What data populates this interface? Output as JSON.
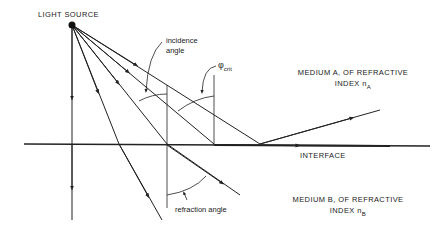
{
  "diagram": {
    "type": "refraction / total internal reflection ray diagram",
    "labels": {
      "light_source": "LIGHT SOURCE",
      "incidence_angle_line1": "incidence",
      "incidence_angle_line2": "angle",
      "critical_angle_symbol": "φ",
      "critical_angle_sub": "crit",
      "medium_a_line1": "MEDIUM A, OF REFRACTIVE",
      "medium_a_line2": "INDEX n",
      "medium_a_sub": "A",
      "interface": "INTERFACE",
      "medium_b_line1": "MEDIUM B, OF REFRACTIVE",
      "medium_b_line2": "INDEX n",
      "medium_b_sub": "B",
      "refraction_angle": "refraction angle"
    },
    "colors": {
      "line": "#222222",
      "background": "#ffffff"
    }
  }
}
